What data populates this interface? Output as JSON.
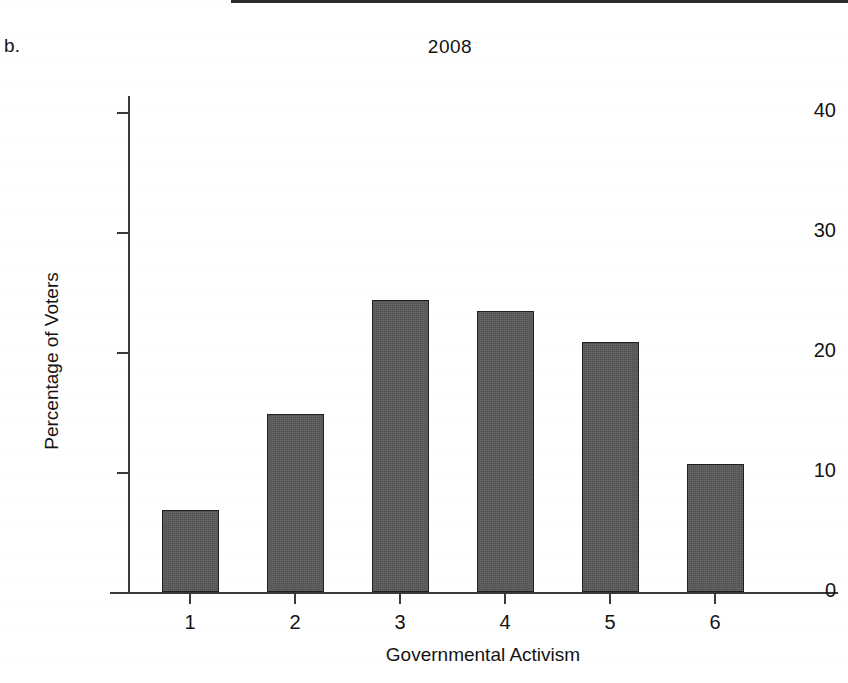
{
  "figure": {
    "panel_label": "b.",
    "title": "2008"
  },
  "chart_data": {
    "type": "bar",
    "title": "2008",
    "xlabel": "Governmental Activism",
    "ylabel": "Percentage of Voters",
    "categories": [
      "1",
      "2",
      "3",
      "4",
      "5",
      "6"
    ],
    "values": [
      6.8,
      14.8,
      24.3,
      23.4,
      20.8,
      10.7
    ],
    "ylim": [
      0,
      43
    ],
    "yticks": [
      0,
      10,
      20,
      30,
      40
    ],
    "ytick_labels": [
      "0",
      "10",
      "20",
      "30",
      "40"
    ],
    "xtick_labels": [
      "1",
      "2",
      "3",
      "4",
      "5",
      "6"
    ],
    "grid": false,
    "legend": null,
    "bar_color": "#595959",
    "bar_edge_color": "#1f1f1f",
    "axis_color": "#3a3a3a",
    "background": "#ffffff"
  }
}
